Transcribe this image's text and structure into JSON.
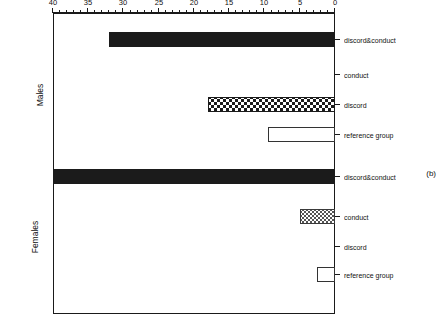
{
  "figure": {
    "caption": "(b)",
    "axis_title": "Percentage of subjects"
  },
  "groups": [
    {
      "name": "Males"
    },
    {
      "name": "Females"
    }
  ],
  "categories": [
    "reference group",
    "discord",
    "conduct",
    "discord&conduct"
  ],
  "ticks": {
    "labels": [
      "0",
      "5",
      "10",
      "15",
      "20",
      "25",
      "30",
      "35",
      "40"
    ],
    "values": [
      0,
      5,
      10,
      15,
      20,
      25,
      30,
      35,
      40
    ]
  },
  "chart_data": {
    "type": "bar",
    "title": "(b)",
    "xlabel": "Percentage of subjects",
    "ylabel": "",
    "xlim": [
      0,
      40
    ],
    "grid": false,
    "legend": "none",
    "orientation": "horizontal",
    "categories": [
      "reference group",
      "discord",
      "conduct",
      "discord&conduct"
    ],
    "series": [
      {
        "name": "Females",
        "values": [
          2.5,
          0,
          5,
          40
        ],
        "fills": [
          "open",
          "none",
          "hatch",
          "solid"
        ]
      },
      {
        "name": "Males",
        "values": [
          9.5,
          18,
          0,
          32
        ],
        "fills": [
          "open",
          "checker",
          "none",
          "solid"
        ]
      }
    ],
    "tick_labels": [
      "0",
      "5",
      "10",
      "15",
      "20",
      "25",
      "30",
      "35",
      "40"
    ]
  }
}
